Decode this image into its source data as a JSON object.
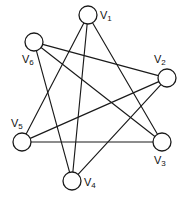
{
  "figure": {
    "background_color": "#ffffff",
    "stroke_color": "#1a1a1a",
    "width": 188,
    "height": 201
  },
  "graph": {
    "node_radius": 9,
    "vertices": [
      {
        "id": "V1",
        "base": "V",
        "sub": "1",
        "cx": 88,
        "cy": 15,
        "label_x": 100,
        "label_y": 16
      },
      {
        "id": "V2",
        "base": "V",
        "sub": "2",
        "cx": 167,
        "cy": 78,
        "label_x": 154,
        "label_y": 60
      },
      {
        "id": "V3",
        "base": "V",
        "sub": "3",
        "cx": 162,
        "cy": 142,
        "label_x": 154,
        "label_y": 161
      },
      {
        "id": "V4",
        "base": "V",
        "sub": "4",
        "cx": 72,
        "cy": 181,
        "label_x": 84,
        "label_y": 183
      },
      {
        "id": "V5",
        "base": "V",
        "sub": "5",
        "cx": 22,
        "cy": 142,
        "label_x": 11,
        "label_y": 124
      },
      {
        "id": "V6",
        "base": "V",
        "sub": "6",
        "cx": 34,
        "cy": 42,
        "label_x": 22,
        "label_y": 60
      }
    ],
    "edges": [
      {
        "from": "V1",
        "to": "V5"
      },
      {
        "from": "V1",
        "to": "V4"
      },
      {
        "from": "V1",
        "to": "V3"
      },
      {
        "from": "V6",
        "to": "V2"
      },
      {
        "from": "V6",
        "to": "V3"
      },
      {
        "from": "V6",
        "to": "V4"
      },
      {
        "from": "V5",
        "to": "V2"
      },
      {
        "from": "V5",
        "to": "V3"
      },
      {
        "from": "V4",
        "to": "V2"
      }
    ]
  }
}
